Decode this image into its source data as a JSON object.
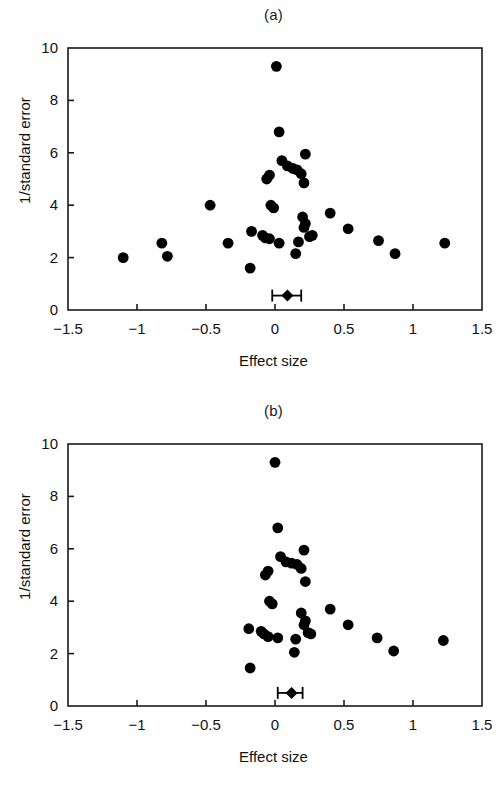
{
  "figure": {
    "background": "#ffffff",
    "marker_color": "#000000",
    "axis_color": "#1a1a1a"
  },
  "panels": [
    {
      "id": "a",
      "title": "(a)",
      "xlabel": "Effect size",
      "ylabel": "1/standard error"
    },
    {
      "id": "b",
      "title": "(b)",
      "xlabel": "Effect size",
      "ylabel": "1/standard error"
    }
  ],
  "chart_data": [
    {
      "type": "scatter",
      "title": "(a)",
      "xlabel": "Effect size",
      "ylabel": "1/standard error",
      "xlim": [
        -1.5,
        1.5
      ],
      "ylim": [
        0,
        10
      ],
      "xticks": [
        -1.5,
        -1,
        -0.5,
        0,
        0.5,
        1,
        1.5
      ],
      "xticklabels": [
        "−1.5",
        "−1",
        "−0.5",
        "0",
        "0.5",
        "1",
        "1.5"
      ],
      "yticks": [
        0,
        2,
        4,
        6,
        8,
        10
      ],
      "yticklabels": [
        "0",
        "2",
        "4",
        "6",
        "8",
        "10"
      ],
      "grid": false,
      "legend": "none",
      "marker": "filled-circle",
      "points": [
        [
          0.01,
          9.3
        ],
        [
          0.03,
          6.8
        ],
        [
          0.22,
          5.95
        ],
        [
          0.05,
          5.7
        ],
        [
          0.09,
          5.5
        ],
        [
          0.13,
          5.4
        ],
        [
          0.16,
          5.35
        ],
        [
          0.19,
          5.2
        ],
        [
          -0.04,
          5.15
        ],
        [
          -0.06,
          5.0
        ],
        [
          0.21,
          4.85
        ],
        [
          -0.47,
          4.0
        ],
        [
          -0.03,
          4.0
        ],
        [
          -0.01,
          3.9
        ],
        [
          0.4,
          3.7
        ],
        [
          0.2,
          3.55
        ],
        [
          0.22,
          3.3
        ],
        [
          0.21,
          3.15
        ],
        [
          0.53,
          3.1
        ],
        [
          -0.17,
          3.0
        ],
        [
          -0.09,
          2.85
        ],
        [
          -0.07,
          2.75
        ],
        [
          -0.04,
          2.72
        ],
        [
          0.27,
          2.85
        ],
        [
          0.25,
          2.8
        ],
        [
          0.75,
          2.65
        ],
        [
          -0.82,
          2.55
        ],
        [
          -0.34,
          2.55
        ],
        [
          0.03,
          2.55
        ],
        [
          0.17,
          2.6
        ],
        [
          1.23,
          2.55
        ],
        [
          0.87,
          2.15
        ],
        [
          0.15,
          2.15
        ],
        [
          -0.78,
          2.05
        ],
        [
          -1.1,
          2.0
        ],
        [
          -0.18,
          1.6
        ]
      ],
      "summary": {
        "label": "pooled-effect",
        "effect": 0.09,
        "ci_low": -0.02,
        "ci_high": 0.19,
        "y": 0.55,
        "marker": "diamond-with-whiskers"
      }
    },
    {
      "type": "scatter",
      "title": "(b)",
      "xlabel": "Effect size",
      "ylabel": "1/standard error",
      "xlim": [
        -1.5,
        1.5
      ],
      "ylim": [
        0,
        10
      ],
      "xticks": [
        -1.5,
        -1,
        -0.5,
        0,
        0.5,
        1,
        1.5
      ],
      "xticklabels": [
        "−1.5",
        "−1",
        "−0.5",
        "0",
        "0.5",
        "1",
        "1.5"
      ],
      "yticks": [
        0,
        2,
        4,
        6,
        8,
        10
      ],
      "yticklabels": [
        "0",
        "2",
        "4",
        "6",
        "8",
        "10"
      ],
      "grid": false,
      "legend": "none",
      "marker": "filled-circle",
      "points": [
        [
          0.0,
          9.3
        ],
        [
          0.02,
          6.8
        ],
        [
          0.21,
          5.95
        ],
        [
          0.04,
          5.7
        ],
        [
          0.08,
          5.5
        ],
        [
          0.12,
          5.45
        ],
        [
          0.16,
          5.4
        ],
        [
          0.19,
          5.25
        ],
        [
          -0.05,
          5.15
        ],
        [
          -0.07,
          5.0
        ],
        [
          0.22,
          4.75
        ],
        [
          -0.04,
          4.0
        ],
        [
          -0.02,
          3.9
        ],
        [
          0.4,
          3.7
        ],
        [
          0.19,
          3.55
        ],
        [
          0.22,
          3.25
        ],
        [
          0.21,
          3.1
        ],
        [
          0.53,
          3.1
        ],
        [
          -0.19,
          2.95
        ],
        [
          -0.1,
          2.85
        ],
        [
          -0.08,
          2.75
        ],
        [
          -0.05,
          2.65
        ],
        [
          0.26,
          2.75
        ],
        [
          0.24,
          2.8
        ],
        [
          0.74,
          2.6
        ],
        [
          0.02,
          2.6
        ],
        [
          0.15,
          2.55
        ],
        [
          1.22,
          2.5
        ],
        [
          0.86,
          2.1
        ],
        [
          0.14,
          2.05
        ],
        [
          -0.18,
          1.45
        ]
      ],
      "summary": {
        "label": "pooled-effect",
        "effect": 0.12,
        "ci_low": 0.02,
        "ci_high": 0.2,
        "y": 0.5,
        "marker": "diamond-with-whiskers"
      }
    }
  ]
}
